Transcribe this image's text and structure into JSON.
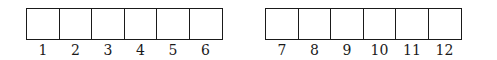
{
  "diagram": {
    "groups": [
      {
        "cells": [
          {
            "label": "1"
          },
          {
            "label": "2"
          },
          {
            "label": "3"
          },
          {
            "label": "4"
          },
          {
            "label": "5"
          },
          {
            "label": "6"
          }
        ]
      },
      {
        "cells": [
          {
            "label": "7"
          },
          {
            "label": "8"
          },
          {
            "label": "9"
          },
          {
            "label": "10"
          },
          {
            "label": "11"
          },
          {
            "label": "12"
          }
        ]
      }
    ]
  }
}
